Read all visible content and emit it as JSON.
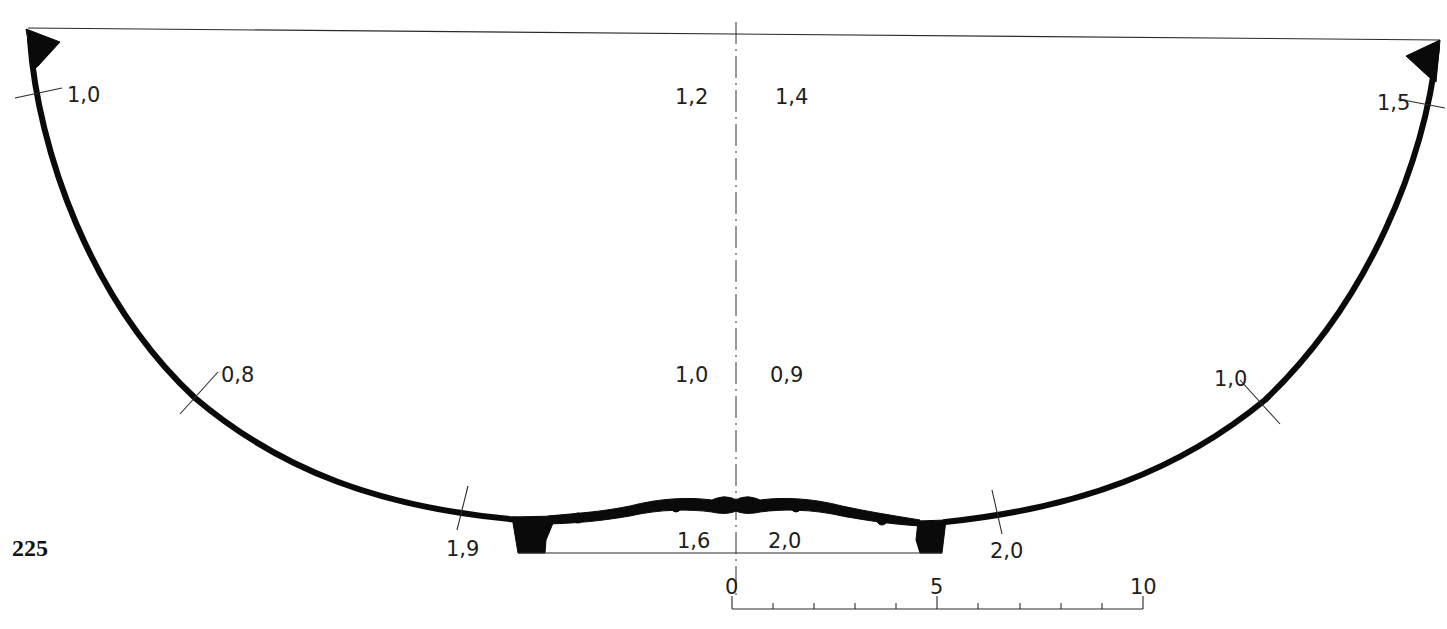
{
  "figure": {
    "number": "225"
  },
  "measurements": {
    "rim_left": "1,0",
    "rim_right": "1,5",
    "upper_center_left": "1,2",
    "upper_center_right": "1,4",
    "mid_wall_left": "0,8",
    "mid_center_left": "1,0",
    "mid_center_right": "0,9",
    "mid_wall_right": "1,0",
    "lower_wall_left": "1,9",
    "base_center_left": "1,6",
    "base_center_right": "2,0",
    "lower_wall_right": "2,0"
  },
  "scale_bar": {
    "labels": [
      "0",
      "5",
      "10"
    ],
    "minor_ticks": 10,
    "unit_hint": "cm"
  },
  "colors": {
    "ink": "#0a0a0a",
    "paper": "#ffffff"
  }
}
